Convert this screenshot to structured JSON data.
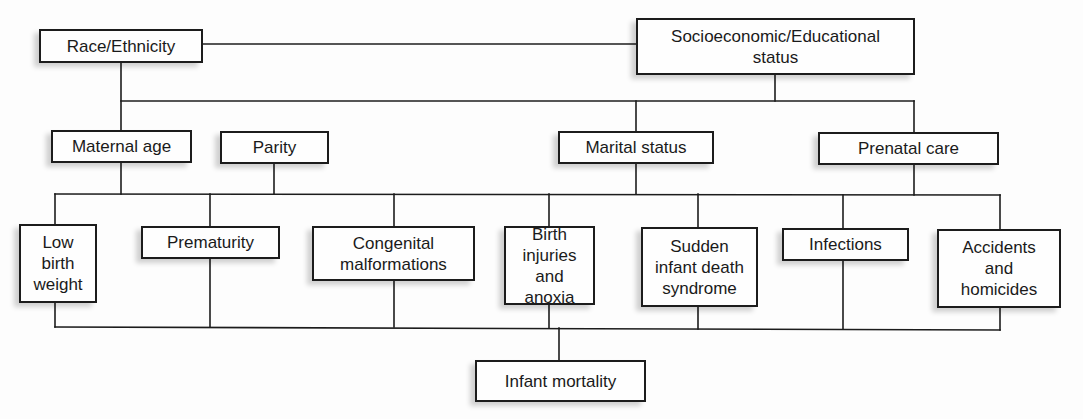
{
  "diagram": {
    "nodes": {
      "race_ethnicity": "Race/Ethnicity",
      "socioeconomic": "Socioeconomic/Educational\nstatus",
      "maternal_age": "Maternal age",
      "parity": "Parity",
      "marital_status": "Marital status",
      "prenatal_care": "Prenatal care",
      "low_birth_weight": "Low\nbirth\nweight",
      "prematurity": "Prematurity",
      "congenital_malformations": "Congenital\nmalformations",
      "birth_injuries": "Birth\ninjuries\nand anoxia",
      "sids": "Sudden\ninfant death\nsyndrome",
      "infections": "Infections",
      "accidents": "Accidents\nand\nhomicides",
      "infant_mortality": "Infant mortality"
    },
    "levels": [
      [
        "Race/Ethnicity",
        "Socioeconomic/Educational status"
      ],
      [
        "Maternal age",
        "Parity",
        "Marital status",
        "Prenatal care"
      ],
      [
        "Low birth weight",
        "Prematurity",
        "Congenital malformations",
        "Birth injuries and anoxia",
        "Sudden infant death syndrome",
        "Infections",
        "Accidents and homicides"
      ],
      [
        "Infant mortality"
      ]
    ],
    "edges": [
      [
        "Race/Ethnicity",
        "Socioeconomic/Educational status"
      ],
      [
        "Race/Ethnicity",
        "Maternal age"
      ],
      [
        "Socioeconomic/Educational status",
        "Marital status"
      ],
      [
        "Socioeconomic/Educational status",
        "Prenatal care"
      ],
      [
        "Maternal age",
        "Low birth weight"
      ],
      [
        "Parity",
        "Prematurity"
      ],
      [
        "Marital status",
        "Birth injuries and anoxia"
      ],
      [
        "Prenatal care",
        "Accidents and homicides"
      ],
      [
        "Low birth weight",
        "Infant mortality"
      ],
      [
        "Prematurity",
        "Infant mortality"
      ],
      [
        "Congenital malformations",
        "Infant mortality"
      ],
      [
        "Birth injuries and anoxia",
        "Infant mortality"
      ],
      [
        "Sudden infant death syndrome",
        "Infant mortality"
      ],
      [
        "Infections",
        "Infant mortality"
      ],
      [
        "Accidents and homicides",
        "Infant mortality"
      ]
    ]
  }
}
